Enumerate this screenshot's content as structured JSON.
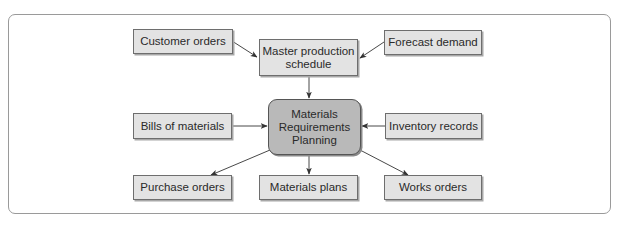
{
  "diagram": {
    "type": "flowchart",
    "title": "",
    "colors": {
      "node_fill": "#e3e3e3",
      "central_node_fill": "#b9b9b9",
      "border": "#6e6e6e",
      "arrow": "#333333",
      "frame": "#9a9a9a"
    },
    "nodes": {
      "customer_orders": {
        "label": "Customer orders"
      },
      "master_schedule": {
        "label": "Master production\nschedule"
      },
      "forecast_demand": {
        "label": "Forecast demand"
      },
      "bills_of_materials": {
        "label": "Bills of materials"
      },
      "mrp": {
        "label": "Materials\nRequirements\nPlanning"
      },
      "inventory_records": {
        "label": "Inventory records"
      },
      "purchase_orders": {
        "label": "Purchase orders"
      },
      "materials_plans": {
        "label": "Materials plans"
      },
      "works_orders": {
        "label": "Works orders"
      }
    },
    "edges": [
      {
        "from": "Customer orders",
        "to": "Master production schedule"
      },
      {
        "from": "Forecast demand",
        "to": "Master production schedule"
      },
      {
        "from": "Master production schedule",
        "to": "Materials Requirements Planning"
      },
      {
        "from": "Bills of materials",
        "to": "Materials Requirements Planning"
      },
      {
        "from": "Inventory records",
        "to": "Materials Requirements Planning"
      },
      {
        "from": "Materials Requirements Planning",
        "to": "Purchase orders"
      },
      {
        "from": "Materials Requirements Planning",
        "to": "Materials plans"
      },
      {
        "from": "Materials Requirements Planning",
        "to": "Works orders"
      }
    ]
  }
}
